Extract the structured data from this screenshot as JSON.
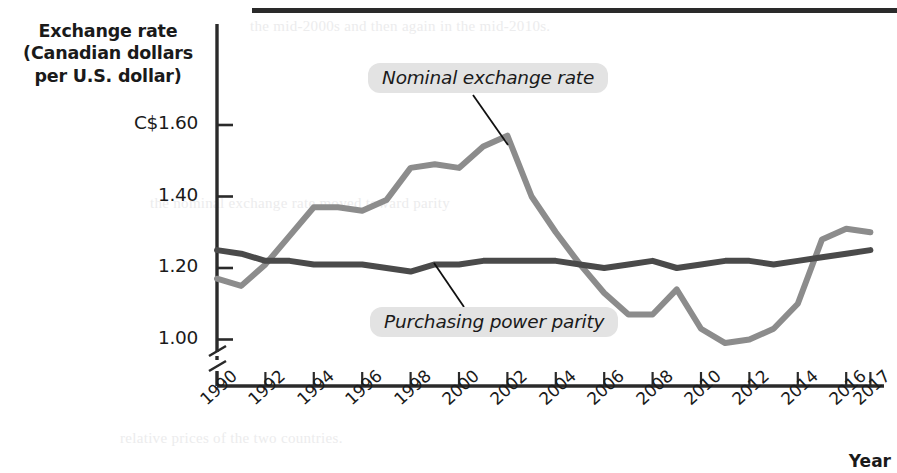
{
  "figure": {
    "y_axis_title": "Exchange rate\n(Canadian dollars\nper U.S. dollar)",
    "y_axis_title_lines": [
      "Exchange rate",
      "(Canadian dollars",
      "per U.S. dollar)"
    ],
    "x_axis_title": "Year",
    "ghost_text": {
      "top": "the mid-2000s and then again in the mid-2010s.",
      "middle": "the nominal exchange rate moved toward parity",
      "bottom": "relative prices of the two countries."
    }
  },
  "annotations": [
    {
      "name": "nominal-exchange-rate-label",
      "text": "Nominal exchange rate"
    },
    {
      "name": "purchasing-power-parity-label",
      "text": "Purchasing power parity"
    }
  ],
  "colors": {
    "nominal_line": "#8c8c8c",
    "ppp_line": "#4a4a4a",
    "axis": "#2a2a2a",
    "label_background": "#e3e3e3",
    "page_background": "#ffffff"
  },
  "chart_data": {
    "type": "line",
    "title": "",
    "xlabel": "Year",
    "ylabel": "Exchange rate (Canadian dollars per U.S. dollar)",
    "grid": false,
    "legend_position": "inline-callout",
    "y_axis_break": true,
    "ylim": [
      0.94,
      1.66
    ],
    "xlim": [
      1990,
      2017
    ],
    "y_ticks": [
      1.0,
      1.2,
      1.4,
      1.6
    ],
    "y_tick_labels": [
      "1.00",
      "1.20",
      "1.40",
      "C$1.60"
    ],
    "x_ticks": [
      1990,
      1992,
      1994,
      1996,
      1998,
      2000,
      2002,
      2004,
      2006,
      2008,
      2010,
      2012,
      2014,
      2016,
      2017
    ],
    "x_tick_labels": [
      "1990",
      "1992",
      "1994",
      "1996",
      "1998",
      "2000",
      "2002",
      "2004",
      "2006",
      "2008",
      "2010",
      "2012",
      "2014",
      "2016",
      "2017"
    ],
    "x": [
      1990,
      1991,
      1992,
      1993,
      1994,
      1995,
      1996,
      1997,
      1998,
      1999,
      2000,
      2001,
      2002,
      2003,
      2004,
      2005,
      2006,
      2007,
      2008,
      2009,
      2010,
      2011,
      2012,
      2013,
      2014,
      2015,
      2016,
      2017
    ],
    "series": [
      {
        "name": "Nominal exchange rate",
        "color": "#8c8c8c",
        "values": [
          1.17,
          1.15,
          1.21,
          1.29,
          1.37,
          1.37,
          1.36,
          1.39,
          1.48,
          1.49,
          1.48,
          1.54,
          1.57,
          1.4,
          1.3,
          1.21,
          1.13,
          1.07,
          1.07,
          1.14,
          1.03,
          0.99,
          1.0,
          1.03,
          1.1,
          1.28,
          1.31,
          1.3
        ]
      },
      {
        "name": "Purchasing power parity",
        "color": "#4a4a4a",
        "values": [
          1.25,
          1.24,
          1.22,
          1.22,
          1.21,
          1.21,
          1.21,
          1.2,
          1.19,
          1.21,
          1.21,
          1.22,
          1.22,
          1.22,
          1.22,
          1.21,
          1.2,
          1.21,
          1.22,
          1.2,
          1.21,
          1.22,
          1.22,
          1.21,
          1.22,
          1.23,
          1.24,
          1.25
        ]
      }
    ]
  }
}
